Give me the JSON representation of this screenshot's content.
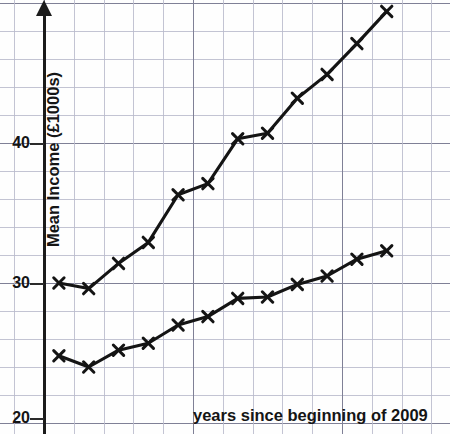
{
  "chart_data": {
    "type": "line",
    "title": "",
    "xlabel": "years since beginning of 2009",
    "ylabel": "Mean Income (£1000s)",
    "xlim": [
      0,
      13.6
    ],
    "ylim": [
      19.3,
      50.3
    ],
    "grid": true,
    "grid_minor_x": 1,
    "grid_minor_y": 2,
    "grid_major_x": 5,
    "grid_major_y": 10,
    "legend": "none",
    "y_ticks": [
      {
        "value": 20,
        "label": "20"
      },
      {
        "value": 30,
        "label": "30"
      },
      {
        "value": 40,
        "label": "40"
      }
    ],
    "x_ticks": [],
    "x": [
      0.5,
      1.5,
      2.5,
      3.5,
      4.5,
      5.5,
      6.5,
      7.5,
      8.5,
      9.5,
      10.5,
      11.5
    ],
    "series": [
      {
        "name": "upper-series",
        "marker": "x",
        "values": [
          30.0,
          29.6,
          31.4,
          32.9,
          36.3,
          37.1,
          40.3,
          40.7,
          43.2,
          44.9,
          47.1,
          49.4
        ]
      },
      {
        "name": "lower-series",
        "marker": "x",
        "values": [
          24.8,
          24.0,
          25.2,
          25.7,
          27.0,
          27.6,
          28.9,
          29.0,
          29.9,
          30.5,
          31.7,
          32.3
        ]
      }
    ],
    "colors": {
      "line": "#141414",
      "grid_minor": "#b9bacb",
      "grid_major": "#7f8096",
      "axis": "#1b1b1b",
      "text": "#141414",
      "background": "#fefefe"
    }
  },
  "axis": {
    "y_label": "Mean Income (£1000s)",
    "x_label": "years since beginning of 2009",
    "tick_20": "20",
    "tick_30": "30",
    "tick_40": "40"
  }
}
